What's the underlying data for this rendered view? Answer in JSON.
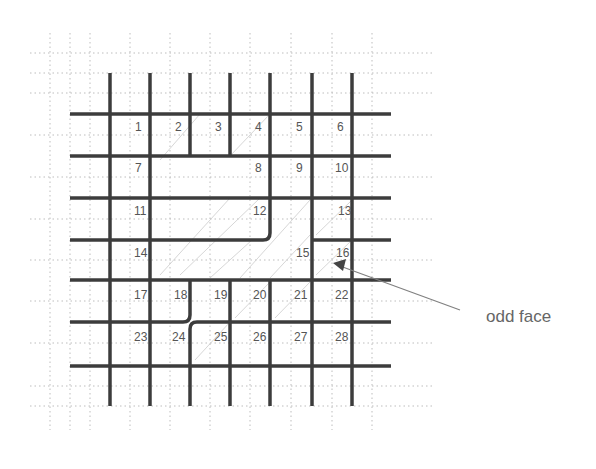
{
  "diagram": {
    "type": "grid-face-diagram",
    "colors": {
      "thick_line": "#3c3c3c",
      "dotted_grid": "#b8b8b8",
      "hatch": "#c8c8c8",
      "label": "#555555",
      "arrow": "#777777"
    },
    "cells": [
      {
        "id": 1,
        "label": "1",
        "x": 135,
        "y": 131
      },
      {
        "id": 2,
        "label": "2",
        "x": 175,
        "y": 131
      },
      {
        "id": 3,
        "label": "3",
        "x": 215,
        "y": 131
      },
      {
        "id": 4,
        "label": "4",
        "x": 255,
        "y": 131
      },
      {
        "id": 5,
        "label": "5",
        "x": 296,
        "y": 131
      },
      {
        "id": 6,
        "label": "6",
        "x": 337,
        "y": 131
      },
      {
        "id": 7,
        "label": "7",
        "x": 135,
        "y": 172
      },
      {
        "id": 8,
        "label": "8",
        "x": 255,
        "y": 172
      },
      {
        "id": 9,
        "label": "9",
        "x": 296,
        "y": 172
      },
      {
        "id": 10,
        "label": "10",
        "x": 335,
        "y": 172
      },
      {
        "id": 11,
        "label": "11",
        "x": 134,
        "y": 215
      },
      {
        "id": 12,
        "label": "12",
        "x": 253,
        "y": 215
      },
      {
        "id": 13,
        "label": "13",
        "x": 338,
        "y": 215
      },
      {
        "id": 14,
        "label": "14",
        "x": 134,
        "y": 257
      },
      {
        "id": 15,
        "label": "15",
        "x": 296,
        "y": 257
      },
      {
        "id": 16,
        "label": "16",
        "x": 336,
        "y": 257
      },
      {
        "id": 17,
        "label": "17",
        "x": 134,
        "y": 299
      },
      {
        "id": 18,
        "label": "18",
        "x": 174,
        "y": 299
      },
      {
        "id": 19,
        "label": "19",
        "x": 214,
        "y": 299
      },
      {
        "id": 20,
        "label": "20",
        "x": 253,
        "y": 299
      },
      {
        "id": 21,
        "label": "21",
        "x": 294,
        "y": 299
      },
      {
        "id": 22,
        "label": "22",
        "x": 335,
        "y": 299
      },
      {
        "id": 23,
        "label": "23",
        "x": 134,
        "y": 341
      },
      {
        "id": 24,
        "label": "24",
        "x": 172,
        "y": 341
      },
      {
        "id": 25,
        "label": "25",
        "x": 214,
        "y": 341
      },
      {
        "id": 26,
        "label": "26",
        "x": 253,
        "y": 341
      },
      {
        "id": 27,
        "label": "27",
        "x": 294,
        "y": 341
      },
      {
        "id": 28,
        "label": "28",
        "x": 335,
        "y": 341
      }
    ],
    "annotation": {
      "label": "odd face",
      "target_cell": "16"
    }
  }
}
